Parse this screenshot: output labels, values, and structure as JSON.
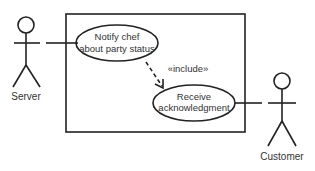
{
  "diagram": {
    "type": "use-case",
    "actors": [
      {
        "id": "server",
        "label": "Server"
      },
      {
        "id": "customer",
        "label": "Customer"
      }
    ],
    "use_cases": [
      {
        "id": "notify",
        "lines": [
          "Notify chef",
          "about party status"
        ]
      },
      {
        "id": "receive",
        "lines": [
          "Receive",
          "acknowledgment"
        ]
      }
    ],
    "relations": [
      {
        "from": "server",
        "to": "notify",
        "type": "association"
      },
      {
        "from": "notify",
        "to": "receive",
        "type": "include",
        "label": "«include»"
      },
      {
        "from": "receive",
        "to": "customer",
        "type": "association"
      }
    ]
  }
}
